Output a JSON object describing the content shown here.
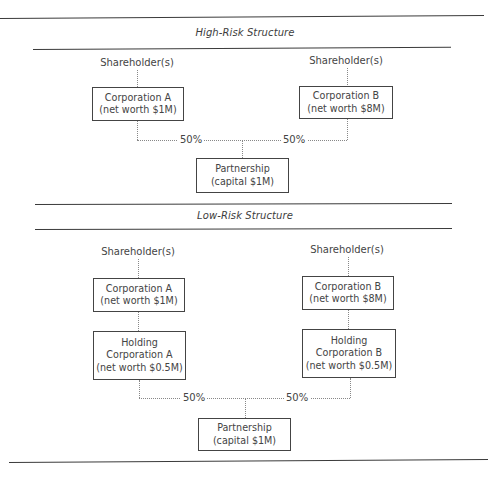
{
  "high_risk": {
    "heading": "High-Risk Structure",
    "shareholder_a": "Shareholder(s)",
    "shareholder_b": "Shareholder(s)",
    "corp_a": {
      "line1": "Corporation A",
      "line2": "(net worth $1M)"
    },
    "corp_b": {
      "line1": "Corporation B",
      "line2": "(net worth $8M)"
    },
    "pct_a": "50%",
    "pct_b": "50%",
    "partnership": {
      "line1": "Partnership",
      "line2": "(capital $1M)"
    }
  },
  "low_risk": {
    "heading": "Low-Risk Structure",
    "shareholder_a": "Shareholder(s)",
    "shareholder_b": "Shareholder(s)",
    "corp_a": {
      "line1": "Corporation A",
      "line2": "(net worth $1M)"
    },
    "corp_b": {
      "line1": "Corporation B",
      "line2": "(net worth $8M)"
    },
    "holding_a": {
      "line1": "Holding",
      "line2": "Corporation A",
      "line3": "(net worth $0.5M)"
    },
    "holding_b": {
      "line1": "Holding",
      "line2": "Corporation B",
      "line3": "(net worth $0.5M)"
    },
    "pct_a": "50%",
    "pct_b": "50%",
    "partnership": {
      "line1": "Partnership",
      "line2": "(capital $1M)"
    }
  }
}
